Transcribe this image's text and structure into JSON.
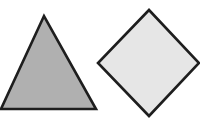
{
  "canvas": {
    "width": 200,
    "height": 122,
    "background": "#ffffff"
  },
  "shapes": [
    {
      "type": "triangle",
      "points": "44,16 1,109 96,109",
      "fill": "#b0b0b0",
      "stroke": "#1e1e1e",
      "stroke_width": 2.6
    },
    {
      "type": "diamond",
      "points": "149,10 98,63 149,116 199,63",
      "fill": "#e6e6e6",
      "stroke": "#1e1e1e",
      "stroke_width": 2.6
    }
  ]
}
